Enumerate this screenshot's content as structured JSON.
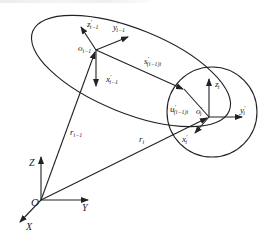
{
  "diagram": {
    "type": "coordinate-frames",
    "colors": {
      "stroke": "#222222",
      "background": "#ffffff"
    },
    "global_frame": {
      "origin_label": "O",
      "axes": {
        "x": "X",
        "y": "Y",
        "z": "Z"
      }
    },
    "frame_prev": {
      "origin_label": "o",
      "origin_sub": "i−1",
      "axes": {
        "x": {
          "base": "x",
          "prime": "′",
          "sub": "i−1"
        },
        "y": {
          "base": "y",
          "prime": "′",
          "sub": "i−1"
        },
        "z": {
          "base": "z",
          "prime": "′",
          "sub": "i−1"
        }
      }
    },
    "frame_curr": {
      "origin_label": "o",
      "origin_prime": "′",
      "origin_sub": "i",
      "axes": {
        "x": {
          "base": "x",
          "prime": "′",
          "sub": "i"
        },
        "y": {
          "base": "y",
          "prime": "′",
          "sub": "i"
        },
        "z": {
          "base": "z",
          "prime": "′",
          "sub": "i"
        }
      }
    },
    "vectors": {
      "r_prev": {
        "base": "r",
        "sub": "i−1"
      },
      "r_curr": {
        "base": "r",
        "sub": "i"
      },
      "s": {
        "base": "s",
        "prime": "′",
        "sub": "(i−1)i"
      },
      "u": {
        "base": "u",
        "prime": "′",
        "sub": "(i−1)i"
      }
    },
    "shapes": [
      "ellipse (body i−1)",
      "circle (body i)"
    ]
  }
}
